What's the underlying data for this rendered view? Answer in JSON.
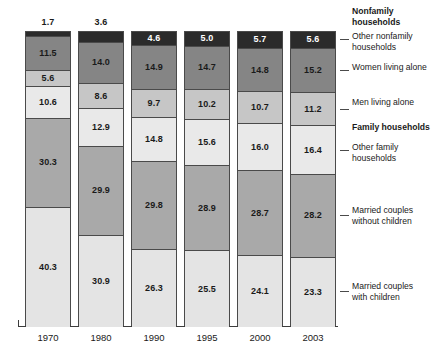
{
  "chart_data": {
    "type": "bar",
    "title": "",
    "subtitle": "",
    "xlabel": "",
    "ylabel": "",
    "ylim": [
      0,
      100
    ],
    "grid": false,
    "legend_position": "right",
    "stacked": true,
    "units": "percent",
    "categories": [
      "1970",
      "1980",
      "1990",
      "1995",
      "2000",
      "2003"
    ],
    "series": [
      {
        "name": "Other nonfamily households",
        "group": "Nonfamily households",
        "color": "#2b2b2b",
        "label_color": "on-dark",
        "values": [
          1.7,
          3.6,
          4.6,
          5.0,
          5.7,
          5.6
        ]
      },
      {
        "name": "Women living alone",
        "group": "Nonfamily households",
        "color": "#858585",
        "label_color": "on-light",
        "values": [
          11.5,
          14.0,
          14.9,
          14.7,
          14.8,
          15.2
        ]
      },
      {
        "name": "Men living alone",
        "group": "Nonfamily households",
        "color": "#c6c6c6",
        "label_color": "on-light",
        "values": [
          5.6,
          8.6,
          9.7,
          10.2,
          10.7,
          11.2
        ]
      },
      {
        "name": "Other family households",
        "group": "Family households",
        "color": "#e9e9e9",
        "label_color": "on-light",
        "values": [
          10.6,
          12.9,
          14.8,
          15.6,
          16.0,
          16.4
        ]
      },
      {
        "name": "Married couples without children",
        "group": "Family households",
        "color": "#a9a9a9",
        "label_color": "on-light",
        "values": [
          30.3,
          29.9,
          29.8,
          28.9,
          28.7,
          28.2
        ]
      },
      {
        "name": "Married couples with children",
        "group": "Family households",
        "color": "#e4e4e4",
        "label_color": "on-light",
        "values": [
          40.3,
          30.9,
          26.3,
          25.5,
          24.1,
          23.3
        ]
      }
    ]
  },
  "legend": {
    "entries": [
      {
        "text": "Nonfamily\nhouseholds",
        "heading": true
      },
      {
        "text": "Other nonfamily\nhouseholds",
        "heading": false
      },
      {
        "text": "Women living alone",
        "heading": false
      },
      {
        "text": "Men living alone",
        "heading": false
      },
      {
        "text": "Family households",
        "heading": true
      },
      {
        "text": "Other family\nhouseholds",
        "heading": false
      },
      {
        "text": "Married couples\nwithout children",
        "heading": false
      },
      {
        "text": "Married couples\nwith children",
        "heading": false
      }
    ]
  }
}
